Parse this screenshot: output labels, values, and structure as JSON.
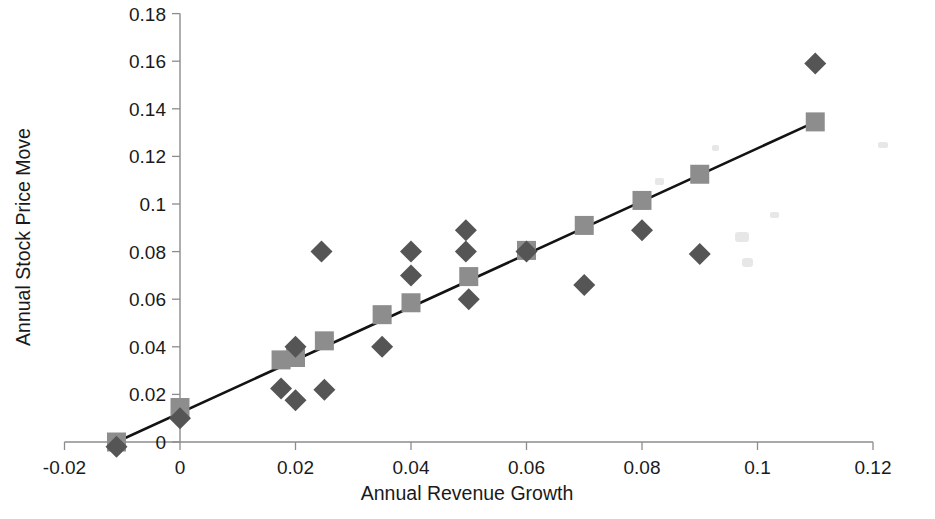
{
  "chart_data": {
    "type": "scatter",
    "title": "",
    "xlabel": "Annual Revenue Growth",
    "ylabel": "Annual Stock Price Move",
    "xlim": [
      -0.02,
      0.12
    ],
    "ylim": [
      0,
      0.18
    ],
    "xticks": [
      "-0.02",
      "0",
      "0.02",
      "0.04",
      "0.06",
      "0.08",
      "0.1",
      "0.12"
    ],
    "xtick_values": [
      -0.02,
      0,
      0.02,
      0.04,
      0.06,
      0.08,
      0.1,
      0.12
    ],
    "yticks": [
      "0",
      "0.02",
      "0.04",
      "0.06",
      "0.08",
      "0.1",
      "0.12",
      "0.14",
      "0.16",
      "0.18"
    ],
    "ytick_values": [
      0,
      0.02,
      0.04,
      0.06,
      0.08,
      0.1,
      0.12,
      0.14,
      0.16,
      0.18
    ],
    "grid": false,
    "legend": "none",
    "series": [
      {
        "name": "Actual",
        "marker": "diamond",
        "color": "#555555",
        "points": [
          {
            "x": -0.011,
            "y": -0.002
          },
          {
            "x": 0.0,
            "y": 0.01
          },
          {
            "x": 0.0175,
            "y": 0.0225
          },
          {
            "x": 0.02,
            "y": 0.04
          },
          {
            "x": 0.02,
            "y": 0.0175
          },
          {
            "x": 0.0245,
            "y": 0.08
          },
          {
            "x": 0.025,
            "y": 0.022
          },
          {
            "x": 0.035,
            "y": 0.04
          },
          {
            "x": 0.04,
            "y": 0.08
          },
          {
            "x": 0.04,
            "y": 0.07
          },
          {
            "x": 0.0495,
            "y": 0.089
          },
          {
            "x": 0.0495,
            "y": 0.08
          },
          {
            "x": 0.05,
            "y": 0.06
          },
          {
            "x": 0.06,
            "y": 0.08
          },
          {
            "x": 0.07,
            "y": 0.066
          },
          {
            "x": 0.08,
            "y": 0.089
          },
          {
            "x": 0.09,
            "y": 0.079
          },
          {
            "x": 0.11,
            "y": 0.159
          }
        ]
      },
      {
        "name": "Fitted",
        "marker": "square",
        "color": "#8d8d8d",
        "points": [
          {
            "x": -0.011,
            "y": 0.0
          },
          {
            "x": 0.0,
            "y": 0.0145
          },
          {
            "x": 0.0175,
            "y": 0.0345
          },
          {
            "x": 0.02,
            "y": 0.0355
          },
          {
            "x": 0.025,
            "y": 0.0425
          },
          {
            "x": 0.035,
            "y": 0.0535
          },
          {
            "x": 0.04,
            "y": 0.0585
          },
          {
            "x": 0.05,
            "y": 0.0695
          },
          {
            "x": 0.06,
            "y": 0.0805
          },
          {
            "x": 0.07,
            "y": 0.091
          },
          {
            "x": 0.08,
            "y": 0.1015
          },
          {
            "x": 0.09,
            "y": 0.1125
          },
          {
            "x": 0.11,
            "y": 0.1345
          }
        ]
      }
    ],
    "trendline": {
      "x0": -0.011,
      "y0": 0.0,
      "x1": 0.11,
      "y1": 0.1345,
      "color": "#131313"
    }
  }
}
